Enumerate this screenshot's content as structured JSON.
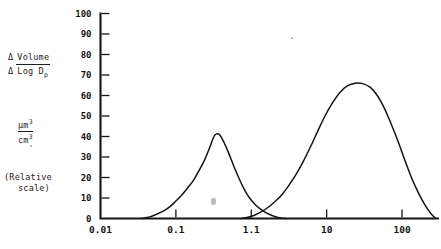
{
  "chart_data": {
    "type": "line",
    "title": "",
    "subtitle": "",
    "xlabel": "",
    "ylabel": "Δ Volume / Δ Log Dₚ",
    "y_units": "µm³/cm³",
    "y_note": "(Relative scale)",
    "x_scale": "log",
    "xlim": [
      0.01,
      300
    ],
    "ylim": [
      0,
      100
    ],
    "grid": false,
    "legend": "none",
    "x_ticks": [
      "0.01",
      "0.1",
      "1.1",
      "10",
      "100"
    ],
    "x_tick_values": [
      0.01,
      0.1,
      1.0,
      10,
      100
    ],
    "y_ticks": [
      "0",
      "10",
      "20",
      "30",
      "40",
      "50",
      "60",
      "70",
      "80",
      "90",
      "100"
    ],
    "y_tick_values": [
      0,
      10,
      20,
      30,
      40,
      50,
      60,
      70,
      80,
      90,
      100
    ],
    "series": [
      {
        "name": "fine mode",
        "peak_x": 0.33,
        "peak_y": 41,
        "points": [
          [
            0.035,
            0
          ],
          [
            0.045,
            0.8
          ],
          [
            0.055,
            2.0
          ],
          [
            0.07,
            3.8
          ],
          [
            0.085,
            6.0
          ],
          [
            0.1,
            8.5
          ],
          [
            0.12,
            11.5
          ],
          [
            0.14,
            14.5
          ],
          [
            0.17,
            18.5
          ],
          [
            0.2,
            23.0
          ],
          [
            0.24,
            28.5
          ],
          [
            0.28,
            34.5
          ],
          [
            0.32,
            40.0
          ],
          [
            0.35,
            41.3
          ],
          [
            0.38,
            40.8
          ],
          [
            0.43,
            37.5
          ],
          [
            0.5,
            32.0
          ],
          [
            0.58,
            26.0
          ],
          [
            0.68,
            20.0
          ],
          [
            0.8,
            14.5
          ],
          [
            0.95,
            10.0
          ],
          [
            1.15,
            6.5
          ],
          [
            1.4,
            4.0
          ],
          [
            1.7,
            2.2
          ],
          [
            2.1,
            0.9
          ],
          [
            2.6,
            0.1
          ],
          [
            2.9,
            0
          ]
        ]
      },
      {
        "name": "coarse mode",
        "peak_x": 26,
        "peak_y": 66,
        "points": [
          [
            0.75,
            0
          ],
          [
            0.9,
            0.6
          ],
          [
            1.1,
            1.6
          ],
          [
            1.35,
            3.2
          ],
          [
            1.7,
            5.6
          ],
          [
            2.1,
            8.5
          ],
          [
            2.6,
            12.0
          ],
          [
            3.2,
            16.5
          ],
          [
            4.0,
            22.0
          ],
          [
            5.0,
            28.5
          ],
          [
            6.2,
            35.5
          ],
          [
            7.7,
            43.0
          ],
          [
            9.5,
            50.0
          ],
          [
            12,
            56.5
          ],
          [
            15,
            61.5
          ],
          [
            19,
            64.8
          ],
          [
            24,
            66.0
          ],
          [
            30,
            65.8
          ],
          [
            38,
            64.0
          ],
          [
            47,
            60.0
          ],
          [
            58,
            54.0
          ],
          [
            72,
            46.0
          ],
          [
            90,
            37.0
          ],
          [
            110,
            28.0
          ],
          [
            135,
            19.5
          ],
          [
            165,
            12.5
          ],
          [
            200,
            6.8
          ],
          [
            240,
            2.6
          ],
          [
            280,
            0
          ]
        ]
      }
    ]
  }
}
